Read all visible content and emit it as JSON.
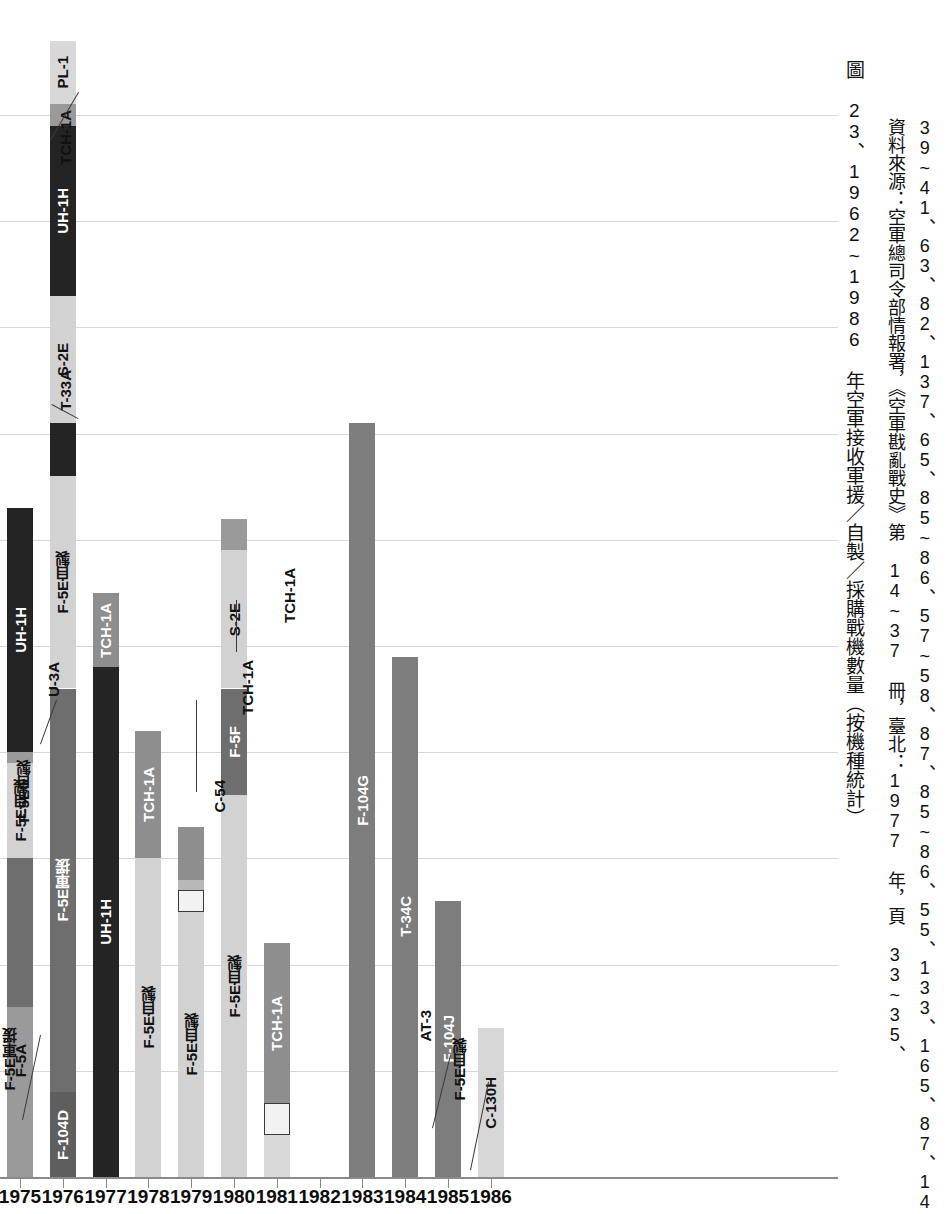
{
  "chart_data": {
    "type": "bar",
    "stacked": true,
    "title": "圖 23、1962~1986 年空軍接收軍援／自製／採購戰機數量（按機種統計）",
    "xlabel": "",
    "ylabel": "",
    "grid": true,
    "legend": "none",
    "note": "Stacked bar chart; segment values estimated from pixel heights against unlabeled gridlines (gridline interval = 10 aircraft).",
    "ylim": [
      0,
      110
    ],
    "gridline_values": [
      10,
      20,
      30,
      40,
      50,
      60,
      70,
      80,
      90,
      100
    ],
    "categories": [
      "1975",
      "1976",
      "1977",
      "1978",
      "1979",
      "1980",
      "1981",
      "1982",
      "1983",
      "1984",
      "1985",
      "1986"
    ],
    "series_colors": {
      "black": "#242424",
      "dark-gray": "#6e6e6e",
      "mid-gray": "#9a9a9a",
      "light-gray": "#d2d2d2",
      "pale-gray": "#e3e3e3",
      "white": "#f4f4f4"
    },
    "bars": [
      {
        "year": "1975",
        "total": 55,
        "segments": [
          {
            "label": "F-5E軍援",
            "value": 6,
            "color": "#9a9a9a",
            "label_mode": "callout"
          },
          {
            "label": "F-5A",
            "value": 10,
            "color": "#9a9a9a",
            "label_mode": "inside"
          },
          {
            "label": "F-5E自製",
            "value": 14,
            "color": "#6e6e6e",
            "label_mode": "callout"
          },
          {
            "label": "F-5E自製",
            "value": 9,
            "color": "#d2d2d2",
            "label_mode": "inside"
          },
          {
            "label": "U-3A",
            "value": 1,
            "color": "#9a9a9a",
            "label_mode": "callout"
          },
          {
            "label": "UH-1H",
            "value": 23,
            "color": "#242424",
            "label_mode": "inside"
          }
        ]
      },
      {
        "year": "1976",
        "total": 99,
        "segments": [
          {
            "label": "F-104D",
            "value": 8,
            "color": "#5e5e5e",
            "label_mode": "inside"
          },
          {
            "label": "F-5E軍援",
            "value": 38,
            "color": "#6e6e6e",
            "label_mode": "inside"
          },
          {
            "label": "F-5E自製",
            "value": 20,
            "color": "#d2d2d2",
            "label_mode": "inside"
          },
          {
            "label": "T-33A",
            "value": 5,
            "color": "#242424",
            "label_mode": "callout"
          },
          {
            "label": "S-2E",
            "value": 12,
            "color": "#d2d2d2",
            "label_mode": "inside"
          },
          {
            "label": "UH-1H",
            "value": 16,
            "color": "#242424",
            "label_mode": "inside"
          },
          {
            "label": "TCH-1A",
            "value": 2,
            "color": "#9a9a9a",
            "label_mode": "callout"
          },
          {
            "label": "PL-1",
            "value": 6,
            "color": "#d8d8d8",
            "label_mode": "inside"
          }
        ]
      },
      {
        "year": "1977",
        "total": 55,
        "segments": [
          {
            "label": "UH-1H",
            "value": 48,
            "color": "#242424",
            "label_mode": "inside"
          },
          {
            "label": "TCH-1A",
            "value": 7,
            "color": "#8e8e8e",
            "label_mode": "inside"
          }
        ]
      },
      {
        "year": "1978",
        "total": 42,
        "segments": [
          {
            "label": "F-5E自製",
            "value": 30,
            "color": "#d2d2d2",
            "label_mode": "inside"
          },
          {
            "label": "TCH-1A",
            "value": 12,
            "color": "#8e8e8e",
            "label_mode": "inside"
          }
        ]
      },
      {
        "year": "1979",
        "total": 33,
        "segments": [
          {
            "label": "F-5E自製",
            "value": 25,
            "color": "#d2d2d2",
            "label_mode": "inside"
          },
          {
            "label": "S-2E",
            "value": 2,
            "color": "#f2f2f2",
            "label_mode": "outside"
          },
          {
            "label": "C-54",
            "value": 1,
            "color": "#b8b8b8",
            "label_mode": "callout"
          },
          {
            "label": "TCH-1A",
            "value": 5,
            "color": "#8e8e8e",
            "label_mode": "callout"
          }
        ]
      },
      {
        "year": "1980",
        "total": 62,
        "segments": [
          {
            "label": "F-5E自製",
            "value": 36,
            "color": "#d2d2d2",
            "label_mode": "inside"
          },
          {
            "label": "F-5F",
            "value": 10,
            "color": "#6e6e6e",
            "label_mode": "inside"
          },
          {
            "label": "S-2E",
            "value": 13,
            "color": "#d2d2d2",
            "label_mode": "inside"
          },
          {
            "label": "TCH-1A",
            "value": 3,
            "color": "#9a9a9a",
            "label_mode": "callout"
          }
        ]
      },
      {
        "year": "1981",
        "total": 22,
        "segments": [
          {
            "label": "F-5E自製",
            "value": 4,
            "color": "#d9d9d9",
            "label_mode": "callout"
          },
          {
            "label": "AT-3",
            "value": 3,
            "color": "#f2f2f2",
            "label_mode": "callout"
          },
          {
            "label": "TCH-1A",
            "value": 15,
            "color": "#8e8e8e",
            "label_mode": "inside"
          }
        ]
      },
      {
        "year": "1982",
        "total": 0,
        "segments": []
      },
      {
        "year": "1983",
        "total": 71,
        "segments": [
          {
            "label": "F-104G",
            "value": 71,
            "color": "#7d7d7d",
            "label_mode": "inside"
          }
        ]
      },
      {
        "year": "1984",
        "total": 49,
        "segments": [
          {
            "label": "T-34C",
            "value": 49,
            "color": "#7d7d7d",
            "label_mode": "inside"
          }
        ]
      },
      {
        "year": "1985",
        "total": 26,
        "segments": [
          {
            "label": "F-104J",
            "value": 26,
            "color": "#7d7d7d",
            "label_mode": "inside"
          }
        ]
      },
      {
        "year": "1986",
        "total": 14,
        "segments": [
          {
            "label": "C-130H",
            "value": 14,
            "color": "#d7d7d7",
            "label_mode": "inside"
          }
        ]
      }
    ]
  },
  "caption": {
    "title": "圖 23、1962~1986 年空軍接收軍援／自製／採購戰機數量（按機種統計）",
    "source_line_1": "資料來源：空軍總司令部情報署，《空軍戡亂戰史》第 14~37 冊，臺北：1977 年，頁 33~35、",
    "source_line_2": "39~41、63、82、137、65、85~86、57~58、87、85~86、55、133、165、87、145~146、103~104、"
  }
}
